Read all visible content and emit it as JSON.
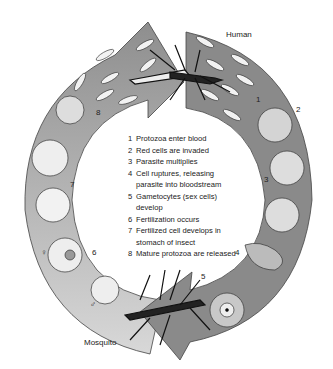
{
  "labels": {
    "human": "Human",
    "mosquito": "Mosquito"
  },
  "steps": [
    {
      "n": "1",
      "text": "Protozoa enter blood"
    },
    {
      "n": "2",
      "text": "Red cells are invaded"
    },
    {
      "n": "3",
      "text": "Parasite multiplies"
    },
    {
      "n": "4",
      "text": "Cell ruptures, releasing parasite into bloodstream"
    },
    {
      "n": "5",
      "text": "Gametocytes (sex cells) develop"
    },
    {
      "n": "6",
      "text": "Fertilization occurs"
    },
    {
      "n": "7",
      "text": "Fertilized cell develops in stomach of insect"
    },
    {
      "n": "8",
      "text": "Mature protozoa are released"
    }
  ],
  "diagram_numbers": [
    "1",
    "2",
    "3",
    "4",
    "5",
    "6",
    "7",
    "8"
  ],
  "symbols": {
    "female": "♀",
    "male": "♂"
  },
  "colors": {
    "human_arc": "#8a8a8a",
    "mosquito_arc": "#b8b8b8",
    "mosquito_arc_top": "#9a9a9a",
    "cell": "#e6e6e6"
  }
}
